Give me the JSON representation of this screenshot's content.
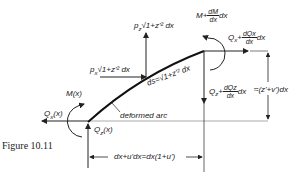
{
  "figure": {
    "caption": "Figure 10.11",
    "labels": {
      "pz": "p",
      "pz_sub": "z",
      "pz_expr": "√1+z'²  dx",
      "px": "p",
      "px_sub": "x",
      "px_expr": "√1+z'²  dx",
      "ds": "ds=√1+z'² dx",
      "M_left": "M(x)",
      "Qx_left": "Q",
      "Qx_left_sub": "x",
      "Qx_left_arg": "(x)",
      "Qz_left": "Q",
      "Qz_left_sub": "z",
      "Qz_left_arg": "(x)",
      "M_right_prefix": "M+",
      "M_right_num": "dM",
      "M_right_den": "dx",
      "M_right_suffix": "dx",
      "Qx_right_prefix": "Q",
      "Qx_right_sub": "x",
      "Qx_right_plus": "+",
      "Qx_right_num": "dQx",
      "Qx_right_den": "dx",
      "Qx_right_suffix": "dx",
      "Qz_right_prefix": "Q",
      "Qz_right_sub": "z",
      "Qz_right_plus": "+",
      "Qz_right_num": "dQz",
      "Qz_right_den": "dx",
      "Qz_right_suffix": "dx",
      "deformed_arc": "deformed arc",
      "vertical_dim": "≈(z'+v')dx",
      "horizontal_dim": "dx+u'dx=dx(1+u')"
    }
  }
}
